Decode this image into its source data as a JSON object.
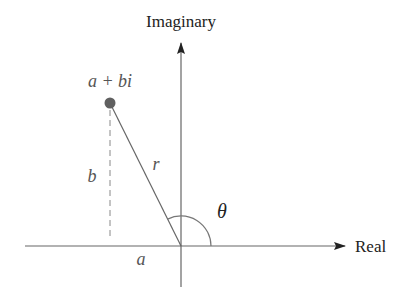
{
  "diagram": {
    "axes": {
      "horizontal_label": "Real",
      "vertical_label": "Imaginary"
    },
    "point": {
      "label": "a + bi",
      "color": "#606060"
    },
    "labels": {
      "real_part": "a",
      "imaginary_part": "b",
      "modulus": "r",
      "angle": "θ"
    },
    "colors": {
      "axis": "#555555",
      "text": "#222222",
      "italic_text": "#555555",
      "dashed": "#888888"
    }
  }
}
